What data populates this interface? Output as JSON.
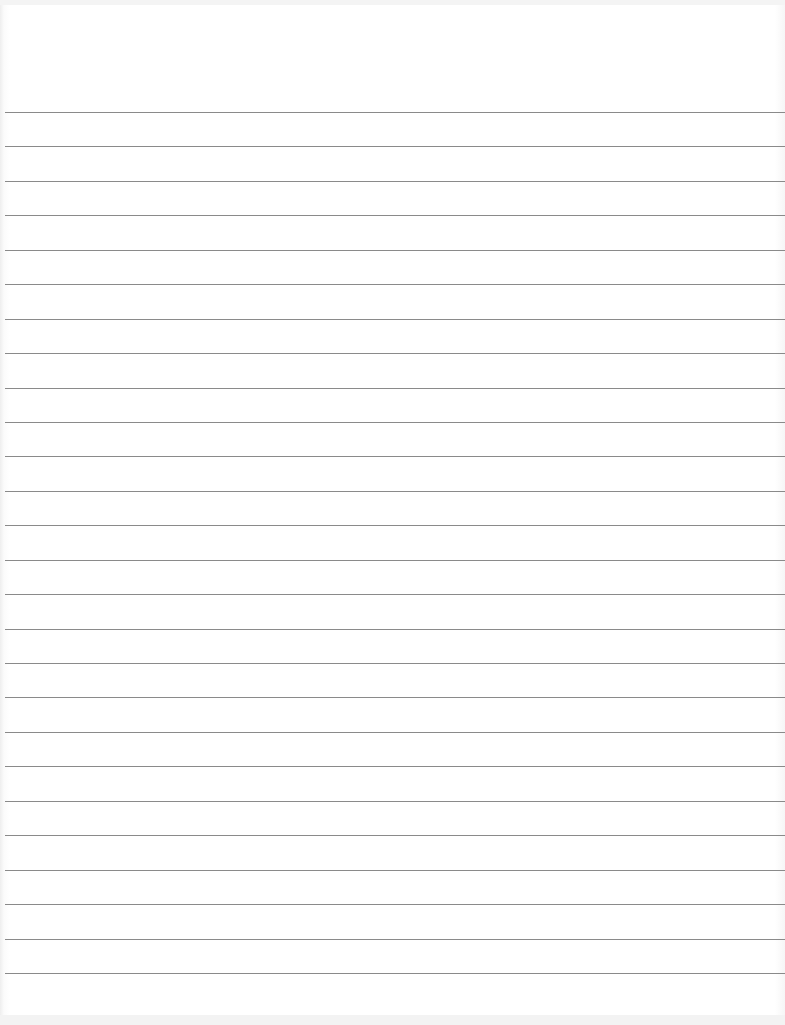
{
  "document": {
    "type": "lined-paper",
    "line_count": 26,
    "first_line_y": 112,
    "line_spacing": 34.44,
    "line_color": "#8a8a8a",
    "paper_color": "#ffffff"
  }
}
